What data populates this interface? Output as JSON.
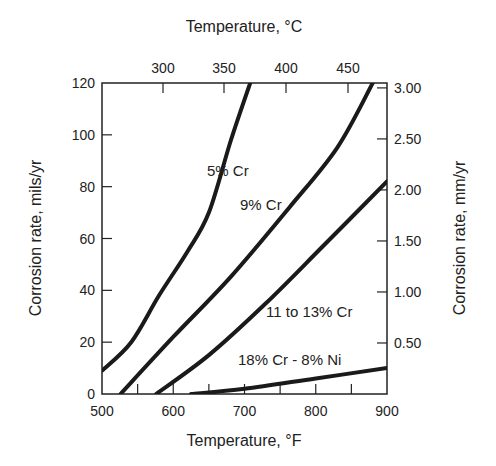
{
  "chart_data": {
    "type": "line",
    "title": "",
    "xlabel": "Temperature, °F",
    "x2label": "Temperature, °C",
    "ylabel": "Corrosion rate, mils/yr",
    "y2label": "Corrosion rate, mm/yr",
    "xlim": [
      500,
      900
    ],
    "ylim": [
      0,
      120
    ],
    "grid": false,
    "x_ticks": [
      500,
      600,
      700,
      800,
      900
    ],
    "x_minor_ticks": [
      550,
      650,
      750,
      850
    ],
    "x2_ticks": [
      {
        "label": "300",
        "px": 163
      },
      {
        "label": "350",
        "px": 224
      },
      {
        "label": "400",
        "px": 286
      },
      {
        "label": "450",
        "px": 348
      }
    ],
    "y_ticks": [
      0,
      20,
      40,
      60,
      80,
      100,
      120
    ],
    "y2_ticks": [
      "0.50",
      "1.00",
      "1.50",
      "2.00",
      "2.50",
      "3.00"
    ],
    "series": [
      {
        "name": "5% Cr",
        "label_pos": [
          207,
          176
        ],
        "points": [
          [
            500,
            9
          ],
          [
            541,
            20
          ],
          [
            580,
            38
          ],
          [
            620,
            55
          ],
          [
            650,
            70
          ],
          [
            681,
            98
          ],
          [
            708,
            120
          ]
        ]
      },
      {
        "name": "9% Cr",
        "label_pos": [
          240,
          210
        ],
        "points": [
          [
            526,
            0
          ],
          [
            600,
            22
          ],
          [
            680,
            45
          ],
          [
            763,
            72
          ],
          [
            830,
            95
          ],
          [
            880,
            120
          ]
        ]
      },
      {
        "name": "11 to 13% Cr",
        "label_pos": [
          266,
          317
        ],
        "points": [
          [
            576,
            0
          ],
          [
            650,
            15
          ],
          [
            730,
            35
          ],
          [
            810,
            57
          ],
          [
            900,
            82
          ]
        ]
      },
      {
        "name": "18% Cr - 8% Ni",
        "label_pos": [
          238,
          365
        ],
        "points": [
          [
            625,
            0
          ],
          [
            700,
            2
          ],
          [
            800,
            6
          ],
          [
            900,
            10
          ]
        ]
      }
    ]
  }
}
